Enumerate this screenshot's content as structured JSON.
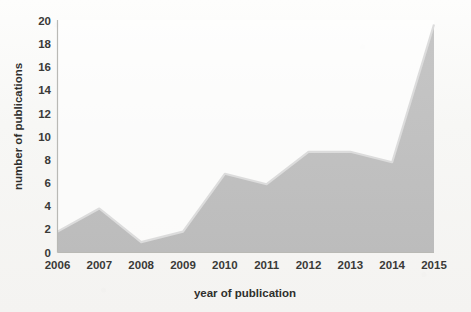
{
  "chart_data": {
    "type": "area",
    "title": "",
    "xlabel": "year of publication",
    "ylabel": "number of publications",
    "categories": [
      "2006",
      "2007",
      "2008",
      "2009",
      "2010",
      "2011",
      "2012",
      "2013",
      "2014",
      "2015"
    ],
    "values": [
      1.8,
      3.8,
      0.9,
      1.8,
      6.8,
      5.9,
      8.7,
      8.7,
      7.8,
      19.7
    ],
    "series": [
      {
        "name": "number of publications",
        "values": [
          1.8,
          3.8,
          0.9,
          1.8,
          6.8,
          5.9,
          8.7,
          8.7,
          7.8,
          19.7
        ]
      }
    ],
    "xlim": [
      2006,
      2015
    ],
    "ylim": [
      0,
      20
    ],
    "yticks": [
      0,
      2,
      4,
      6,
      8,
      10,
      12,
      14,
      16,
      18,
      20
    ],
    "xticks": [
      "2006",
      "2007",
      "2008",
      "2009",
      "2010",
      "2011",
      "2012",
      "2013",
      "2014",
      "2015"
    ],
    "grid": false,
    "legend": "none",
    "colors": {
      "area_fill": "#bfbfbf",
      "area_top_edge": "#d9d9d9",
      "axis": "#b9b9b5",
      "text": "#3a3a38",
      "background": "#fbfbfa"
    }
  },
  "axes": {
    "y_title": "number of publications",
    "x_title": "year of publication",
    "y_tick_labels": [
      "20",
      "18",
      "16",
      "14",
      "12",
      "10",
      "8",
      "6",
      "4",
      "2",
      "0"
    ],
    "x_tick_labels": [
      "2006",
      "2007",
      "2008",
      "2009",
      "2010",
      "2011",
      "2012",
      "2013",
      "2014",
      "2015"
    ]
  }
}
